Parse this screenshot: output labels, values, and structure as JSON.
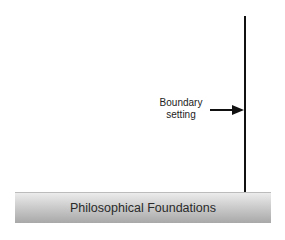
{
  "diagram": {
    "boundary_label_line1": "Boundary",
    "boundary_label_line2": "setting",
    "foundation_label": "Philosophical Foundations",
    "colors": {
      "line": "#111111",
      "bar_top": "#ececec",
      "bar_bottom": "#a8a8a8",
      "text": "#2a2a2a"
    }
  }
}
